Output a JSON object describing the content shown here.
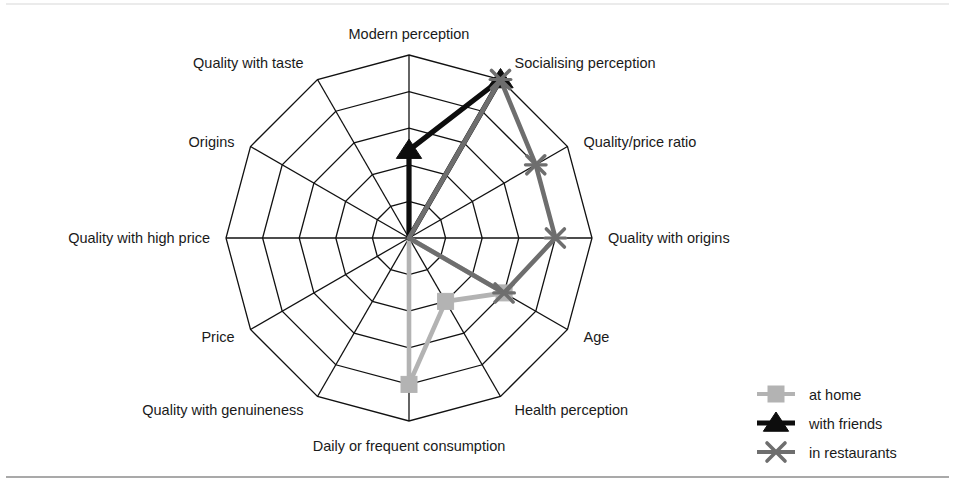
{
  "chart_data": {
    "type": "radar",
    "title": "",
    "xlabel": "",
    "ylabel": "",
    "rings": 5,
    "rmin": 0,
    "rmax": 5,
    "grid": true,
    "legend_position": "bottom-right",
    "categories": [
      "Modern perception",
      "Socialising perception",
      "Quality/price ratio",
      "Quality with origins",
      "Age",
      "Health perception",
      "Daily or frequent consumption",
      "Quality with genuineness",
      "Price",
      "Quality with high price",
      "Origins",
      "Quality with taste"
    ],
    "series": [
      {
        "name": "at home",
        "color": "#b3b3b3",
        "marker": "square",
        "values": [
          0,
          0,
          0,
          0,
          3,
          2,
          4,
          0,
          0,
          0,
          0,
          0
        ]
      },
      {
        "name": "with friends",
        "color": "#0d0d0d",
        "marker": "triangle",
        "values": [
          2.4,
          5,
          0,
          0,
          0,
          0,
          0,
          0,
          0,
          0,
          0,
          0
        ]
      },
      {
        "name": "in restaurants",
        "color": "#6e6e6e",
        "marker": "x",
        "values": [
          0,
          5,
          4,
          4,
          3,
          0,
          0,
          0,
          0,
          0,
          0,
          0
        ]
      }
    ]
  },
  "legend": {
    "items": [
      {
        "label": "at home"
      },
      {
        "label": "with friends"
      },
      {
        "label": "in restaurants"
      }
    ]
  },
  "figure": {
    "center_x": 409,
    "center_y": 238,
    "outer_radius": 183
  }
}
